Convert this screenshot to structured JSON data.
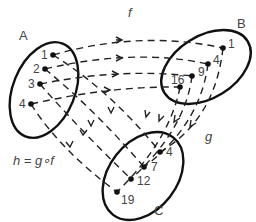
{
  "diagram": {
    "functions": {
      "f": "f",
      "g": "g",
      "h": "h = g∘f"
    },
    "sets": {
      "A": {
        "label": "A",
        "elements": [
          "1",
          "2",
          "3",
          "4"
        ]
      },
      "B": {
        "label": "B",
        "elements": [
          "1",
          "4",
          "9",
          "16"
        ]
      },
      "C": {
        "label": "C",
        "elements": [
          "4",
          "7",
          "12",
          "19"
        ]
      }
    },
    "mappings": {
      "f": [
        [
          "1",
          "1"
        ],
        [
          "2",
          "4"
        ],
        [
          "3",
          "9"
        ],
        [
          "4",
          "16"
        ]
      ],
      "g": [
        [
          "1",
          "4"
        ],
        [
          "4",
          "7"
        ],
        [
          "9",
          "12"
        ],
        [
          "16",
          "19"
        ]
      ],
      "h": [
        [
          "1",
          "4"
        ],
        [
          "2",
          "7"
        ],
        [
          "3",
          "12"
        ],
        [
          "4",
          "19"
        ]
      ]
    }
  }
}
